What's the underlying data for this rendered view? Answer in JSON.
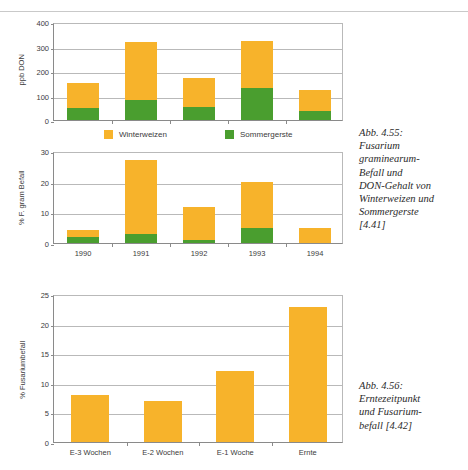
{
  "page": {
    "top_rule": "horizontal-rule"
  },
  "legend": {
    "items": [
      {
        "label": "Winterweizen",
        "color": "#F7B32B",
        "name": "legend-winterweizen"
      },
      {
        "label": "Sommergerste",
        "color": "#4A9E2F",
        "name": "legend-sommergerste"
      }
    ]
  },
  "colors": {
    "winterweizen": "#F7B32B",
    "sommergerste": "#4A9E2F",
    "axis": "#8a8a8a",
    "grid": "#b9b9b9",
    "text": "#3b3b3b"
  },
  "captions": [
    {
      "name": "caption-abb-4-55",
      "lines": [
        "Abb. 4.55:",
        "Fusarium",
        "graminearum-",
        "Befall und",
        "DON-Gehalt von",
        "Winterweizen und",
        "Sommergerste",
        "[4.41]"
      ],
      "text": "Abb. 4.55: Fusarium graminearum-Befall und DON-Gehalt von Winterweizen und Sommergerste [4.41]"
    },
    {
      "name": "caption-abb-4-56",
      "lines": [
        "Abb. 4.56:",
        "Erntezeitpunkt",
        "und Fusarium-",
        "befall [4.42]"
      ],
      "text": "Abb. 4.56: Erntezeitpunkt und Fusariumbefall [4.42]"
    }
  ],
  "chart_data": [
    {
      "id": "chart-don",
      "type": "bar",
      "stacked": true,
      "title": "",
      "xlabel": "",
      "ylabel": "ppb DON",
      "categories": [
        "1990",
        "1991",
        "1992",
        "1993",
        "1994"
      ],
      "xtick_labels_visible": false,
      "ylim": [
        0,
        400
      ],
      "yticks": [
        0,
        100,
        200,
        300,
        400
      ],
      "ytick_labels": [
        "0",
        "100",
        "200",
        "300",
        "400"
      ],
      "grid": true,
      "legend": "bottom",
      "series": [
        {
          "name": "Sommergerste",
          "color": "#4A9E2F",
          "values": [
            50,
            80,
            55,
            130,
            37
          ]
        },
        {
          "name": "Winterweizen",
          "color": "#F7B32B",
          "values": [
            100,
            240,
            117,
            192,
            85
          ]
        }
      ],
      "totals": [
        150,
        320,
        172,
        322,
        122
      ]
    },
    {
      "id": "chart-fgram",
      "type": "bar",
      "stacked": true,
      "title": "",
      "xlabel": "",
      "ylabel": "% F. gram Befall",
      "categories": [
        "1990",
        "1991",
        "1992",
        "1993",
        "1994"
      ],
      "xtick_labels_visible": true,
      "ylim": [
        0,
        30
      ],
      "yticks": [
        0,
        10,
        20,
        30
      ],
      "ytick_labels": [
        "0",
        "10",
        "20",
        "30"
      ],
      "grid": true,
      "legend": "none",
      "series": [
        {
          "name": "Sommergerste",
          "color": "#4A9E2F",
          "values": [
            2.0,
            3.0,
            1.0,
            5.0,
            0.0
          ]
        },
        {
          "name": "Winterweizen",
          "color": "#F7B32B",
          "values": [
            2.1,
            24.0,
            10.8,
            14.8,
            5.0
          ]
        }
      ],
      "totals": [
        4.1,
        27.0,
        11.8,
        19.8,
        5.0
      ]
    },
    {
      "id": "chart-erntezeitpunkt",
      "type": "bar",
      "stacked": false,
      "title": "",
      "xlabel": "",
      "ylabel": "% Fusariumbefall",
      "categories": [
        "E-3 Wochen",
        "E-2 Wochen",
        "E-1 Woche",
        "Ernte"
      ],
      "xtick_labels_visible": true,
      "ylim": [
        0,
        25
      ],
      "yticks": [
        0,
        5,
        10,
        15,
        20,
        25
      ],
      "ytick_labels": [
        "0",
        "5",
        "10",
        "15",
        "20",
        "25"
      ],
      "grid": true,
      "legend": "none",
      "series": [
        {
          "name": "Fusariumbefall",
          "color": "#F7B32B",
          "values": [
            8.0,
            7.0,
            12.0,
            22.8
          ]
        }
      ]
    }
  ]
}
